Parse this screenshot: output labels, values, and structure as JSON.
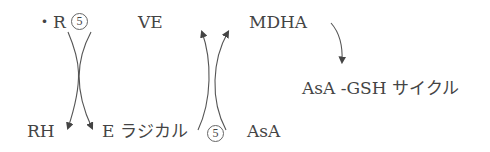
{
  "diagram": {
    "labels": {
      "radical_r": "・R",
      "ve": "VE",
      "mdha": "MDHA",
      "asa_gsh_cycle": "AsA -GSH サイクル",
      "rh": "RH",
      "e_radical": "E ラジカル",
      "asa": "AsA"
    },
    "markers": {
      "circle_top": "5",
      "circle_bottom": "5"
    },
    "colors": {
      "text": "#444444",
      "arrow": "#444444",
      "background": "#ffffff"
    }
  }
}
